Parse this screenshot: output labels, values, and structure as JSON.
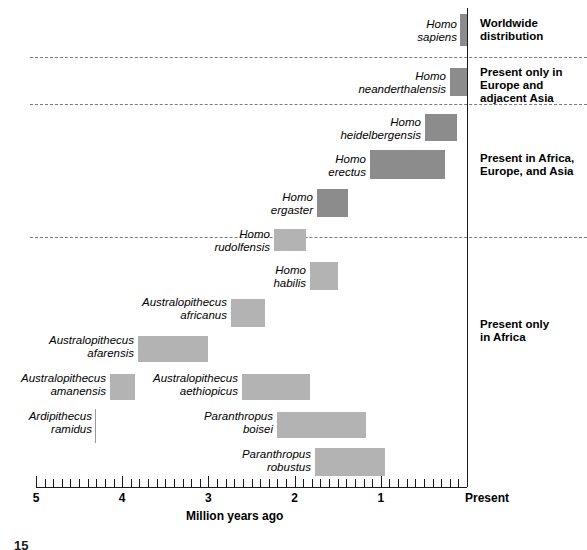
{
  "figure": {
    "number": "15",
    "axis_title": "Million years ago",
    "present_label": "Present",
    "axis_tick_labels": [
      "5",
      "4",
      "3",
      "2",
      "1"
    ],
    "axis_tick_values": [
      5,
      4,
      3,
      2,
      1
    ],
    "minor_tick_step": 0.1
  },
  "groups": [
    {
      "id": "worldwide",
      "caption_lines": [
        "Worldwide",
        "distribution"
      ]
    },
    {
      "id": "europe-asia",
      "caption_lines": [
        "Present only in",
        "Europe and",
        "adjacent Asia"
      ]
    },
    {
      "id": "africa-europe-asia",
      "caption_lines": [
        "Present in Africa,",
        "Europe, and Asia"
      ]
    },
    {
      "id": "africa-only",
      "caption_lines": [
        "Present only",
        "in Africa"
      ]
    }
  ],
  "taxa": [
    {
      "id": "homo-sapiens",
      "genus": "Homo",
      "species": "sapiens",
      "group": "worldwide",
      "start_mya": 0.08,
      "end_mya": 0.0,
      "shade": "dark"
    },
    {
      "id": "homo-neanderthalensis",
      "genus": "Homo",
      "species": "neanderthalensis",
      "group": "europe-asia",
      "start_mya": 0.2,
      "end_mya": 0.0,
      "shade": "dark"
    },
    {
      "id": "homo-heidelbergensis",
      "genus": "Homo",
      "species": "heidelbergensis",
      "group": "africa-europe-asia",
      "start_mya": 0.49,
      "end_mya": 0.12,
      "shade": "dark"
    },
    {
      "id": "homo-erectus",
      "genus": "Homo",
      "species": "erectus",
      "group": "africa-europe-asia",
      "start_mya": 1.12,
      "end_mya": 0.26,
      "shade": "dark"
    },
    {
      "id": "homo-ergaster",
      "genus": "Homo",
      "species": "ergaster",
      "group": "africa-europe-asia",
      "start_mya": 1.74,
      "end_mya": 1.38,
      "shade": "dark"
    },
    {
      "id": "homo-rudolfensis",
      "genus": "Homo",
      "species": "rudolfensis",
      "group": "africa-only",
      "start_mya": 2.24,
      "end_mya": 1.87,
      "shade": "light"
    },
    {
      "id": "homo-habilis",
      "genus": "Homo",
      "species": "habilis",
      "group": "africa-only",
      "start_mya": 1.82,
      "end_mya": 1.5,
      "shade": "light"
    },
    {
      "id": "australopithecus-africanus",
      "genus": "Australopithecus",
      "species": "africanus",
      "group": "africa-only",
      "start_mya": 2.74,
      "end_mya": 2.34,
      "shade": "light"
    },
    {
      "id": "australopithecus-afarensis",
      "genus": "Australopithecus",
      "species": "afarensis",
      "group": "africa-only",
      "start_mya": 3.82,
      "end_mya": 3.0,
      "shade": "light"
    },
    {
      "id": "australopithecus-amanensis",
      "genus": "Australopithecus",
      "species": "amanensis",
      "group": "africa-only",
      "start_mya": 4.14,
      "end_mya": 3.85,
      "shade": "light"
    },
    {
      "id": "australopithecus-aethiopicus",
      "genus": "Australopithecus",
      "species": "aethiopicus",
      "group": "africa-only",
      "start_mya": 2.61,
      "end_mya": 1.82,
      "shade": "light"
    },
    {
      "id": "ardipithecus-ramidus",
      "genus": "Ardipithecus",
      "species": "ramidus",
      "group": "africa-only",
      "start_mya": null,
      "end_mya": null,
      "shade": "none"
    },
    {
      "id": "paranthropus-boisei",
      "genus": "Paranthropus",
      "species": "boisei",
      "group": "africa-only",
      "start_mya": 2.2,
      "end_mya": 1.17,
      "shade": "light"
    },
    {
      "id": "paranthropus-robustus",
      "genus": "Paranthropus",
      "species": "robustus",
      "group": "africa-only",
      "start_mya": 1.76,
      "end_mya": 0.95,
      "shade": "light"
    }
  ],
  "chart_data": {
    "type": "bar",
    "title": "",
    "xlabel": "Million years ago",
    "ylabel": "",
    "xlim": [
      5,
      0
    ],
    "x_axis_inverted": true,
    "grid": false,
    "legend": "right-side group captions",
    "orientation": "horizontal-ranges",
    "xtick_labels": [
      "5",
      "4",
      "3",
      "2",
      "1",
      "Present"
    ],
    "xtick_values": [
      5,
      4,
      3,
      2,
      1,
      0
    ],
    "categories": [
      "Homo sapiens",
      "Homo neanderthalensis",
      "Homo heidelbergensis",
      "Homo erectus",
      "Homo ergaster",
      "Homo rudolfensis",
      "Homo habilis",
      "Australopithecus africanus",
      "Australopithecus afarensis",
      "Australopithecus amanensis",
      "Australopithecus aethiopicus",
      "Ardipithecus ramidus",
      "Paranthropus boisei",
      "Paranthropus robustus"
    ],
    "ranges_mya": [
      [
        0.08,
        0.0
      ],
      [
        0.2,
        0.0
      ],
      [
        0.49,
        0.12
      ],
      [
        1.12,
        0.26
      ],
      [
        1.74,
        1.38
      ],
      [
        2.24,
        1.87
      ],
      [
        1.82,
        1.5
      ],
      [
        2.74,
        2.34
      ],
      [
        3.82,
        3.0
      ],
      [
        4.14,
        3.85
      ],
      [
        2.61,
        1.82
      ],
      [
        null,
        null
      ],
      [
        2.2,
        1.17
      ],
      [
        1.76,
        0.95
      ]
    ],
    "annotations": [
      "Worldwide distribution",
      "Present only in Europe and adjacent Asia",
      "Present in Africa, Europe, and Asia",
      "Present only in Africa"
    ]
  },
  "layout": {
    "axis_x_left_px": 36,
    "axis_x_right_px": 467,
    "axis_y_px": 487,
    "rows": [
      {
        "id": "homo-sapiens",
        "bar_top": 14,
        "bar_height": 32,
        "label_right": 457,
        "label_top": 18
      },
      {
        "id": "homo-neanderthalensis",
        "bar_top": 68,
        "bar_height": 28,
        "label_right": 446,
        "label_top": 70
      },
      {
        "id": "homo-heidelbergensis",
        "bar_top": 114,
        "bar_height": 27,
        "label_right": 421,
        "label_top": 116
      },
      {
        "id": "homo-erectus",
        "bar_top": 150,
        "bar_height": 29,
        "label_right": 366,
        "label_top": 153
      },
      {
        "id": "homo-ergaster",
        "bar_top": 189,
        "bar_height": 28,
        "label_right": 313,
        "label_top": 191
      },
      {
        "id": "homo-rudolfensis",
        "bar_top": 229,
        "bar_height": 22,
        "label_right": 270,
        "label_top": 228
      },
      {
        "id": "homo-habilis",
        "bar_top": 262,
        "bar_height": 28,
        "label_right": 306,
        "label_top": 264
      },
      {
        "id": "australopithecus-africanus",
        "bar_top": 299,
        "bar_height": 28,
        "label_right": 227,
        "label_top": 296
      },
      {
        "id": "australopithecus-afarensis",
        "bar_top": 336,
        "bar_height": 26,
        "label_right": 134,
        "label_top": 334
      },
      {
        "id": "australopithecus-amanensis",
        "bar_top": 374,
        "bar_height": 26,
        "label_right": 106,
        "label_top": 372
      },
      {
        "id": "australopithecus-aethiopicus",
        "bar_top": 374,
        "bar_height": 26,
        "label_right": 238,
        "label_top": 372
      },
      {
        "id": "ardipithecus-ramidus",
        "bar_top": 0,
        "bar_height": 0,
        "label_right": 92,
        "label_top": 410
      },
      {
        "id": "paranthropus-boisei",
        "bar_top": 412,
        "bar_height": 26,
        "label_right": 273,
        "label_top": 410
      },
      {
        "id": "paranthropus-robustus",
        "bar_top": 448,
        "bar_height": 28,
        "label_right": 311,
        "label_top": 448
      }
    ],
    "separators_y": [
      57,
      104,
      237
    ],
    "group_captions": [
      {
        "id": "worldwide",
        "left": 480,
        "top": 17
      },
      {
        "id": "europe-asia",
        "left": 480,
        "top": 66
      },
      {
        "id": "africa-europe-asia",
        "left": 480,
        "top": 152
      },
      {
        "id": "africa-only",
        "left": 480,
        "top": 318
      }
    ]
  }
}
